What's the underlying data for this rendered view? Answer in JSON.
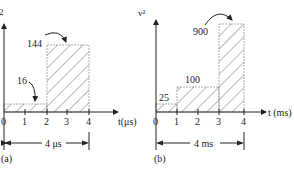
{
  "panels": [
    {
      "id": "a",
      "caption": "(a)",
      "y_axis_label": "2",
      "x_axis_label": "t(μs)",
      "ticks": [
        "0",
        "1",
        "2",
        "3",
        "4"
      ],
      "bars": [
        {
          "from": 0,
          "to": 2,
          "value": 16,
          "label": "16"
        },
        {
          "from": 2,
          "to": 4,
          "value": 144,
          "label": "144"
        }
      ],
      "duration_label": "4 μs"
    },
    {
      "id": "b",
      "caption": "(b)",
      "y_axis_label": "v²",
      "x_axis_label": "t (ms)",
      "ticks": [
        "0",
        "1",
        "2",
        "3",
        "4"
      ],
      "bars": [
        {
          "from": 0,
          "to": 1,
          "value": 25,
          "label": "25"
        },
        {
          "from": 1,
          "to": 3,
          "value": 100,
          "label": "100"
        },
        {
          "from": 3,
          "to": 4,
          "value": 900,
          "label": "900"
        }
      ],
      "duration_label": "4 ms"
    }
  ],
  "colors": {
    "line": "#222222",
    "hatch": "#444444",
    "fill": "#ffffff"
  }
}
